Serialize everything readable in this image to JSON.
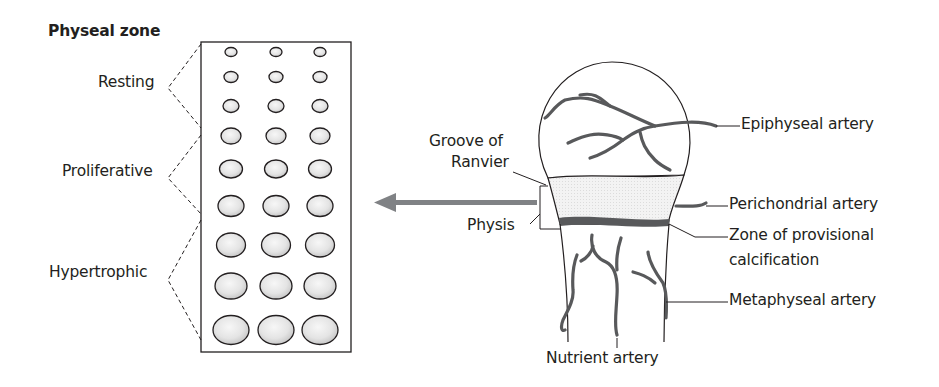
{
  "title": "Physeal zone",
  "zones": [
    {
      "label": "Resting"
    },
    {
      "label": "Proliferative"
    },
    {
      "label": "Hypertrophic"
    }
  ],
  "bone_labels": {
    "groove": [
      "Groove of",
      "Ranvier"
    ],
    "physis": "Physis",
    "epiphyseal_artery": "Epiphyseal artery",
    "perichondrial_artery": "Perichondrial artery",
    "zone_provisional": [
      "Zone of provisional",
      "calcification"
    ],
    "metaphyseal_artery": "Metaphyseal artery",
    "nutrient_artery": "Nutrient artery"
  },
  "colors": {
    "line": "#231f20",
    "vessel_fill": "#6d6e71",
    "arrow": "#808285",
    "calcification": "#58595b",
    "physis_fill": "#f1f1f2"
  }
}
